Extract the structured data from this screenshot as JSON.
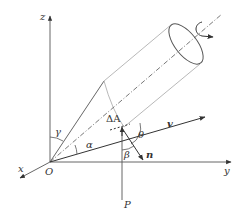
{
  "figure": {
    "colors": {
      "ink": "#333333",
      "light": "#b0b0b0",
      "axis_line": "#555555"
    }
  },
  "axes": {
    "x": "x",
    "y": "y",
    "z": "z",
    "origin": "O"
  },
  "labels": {
    "gamma": "γ",
    "alpha": "α",
    "area": "ΔA",
    "theta": "θ",
    "beta": "β",
    "velocity": "v",
    "normal": "n",
    "force_line": "P"
  },
  "icons": {
    "rotation": "rotation-arrow-icon"
  }
}
